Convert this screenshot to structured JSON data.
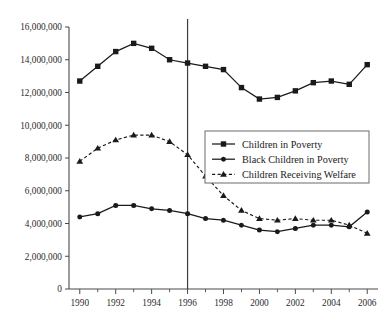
{
  "chart_data": {
    "type": "line",
    "title": "",
    "subtitle": "",
    "xlabel": "",
    "ylabel": "",
    "x": [
      1990,
      1991,
      1992,
      1993,
      1994,
      1995,
      1996,
      1997,
      1998,
      1999,
      2000,
      2001,
      2002,
      2003,
      2004,
      2005,
      2006
    ],
    "xlim": [
      1989.4,
      2006.6
    ],
    "ylim": [
      0,
      16000000
    ],
    "ytick_values": [
      0,
      2000000,
      4000000,
      6000000,
      8000000,
      10000000,
      12000000,
      14000000,
      16000000
    ],
    "ytick_labels": [
      "0",
      "2,000,000",
      "4,000,000",
      "6,000,000",
      "8,000,000",
      "10,000,000",
      "12,000,000",
      "14,000,000",
      "16,000,000"
    ],
    "xtick_values": [
      1990,
      1992,
      1994,
      1996,
      1998,
      2000,
      2002,
      2004,
      2006
    ],
    "xtick_labels": [
      "1990",
      "1992",
      "1994",
      "1996",
      "1998",
      "2000",
      "2002",
      "2004",
      "2006"
    ],
    "xtick_minor_values": [
      1991,
      1993,
      1995,
      1997,
      1999,
      2001,
      2003,
      2005
    ],
    "grid": false,
    "legend_position": "center-right",
    "annotations": [
      {
        "name": "welfare-reform-reference-line",
        "type": "vline",
        "x": 1996,
        "label": ""
      }
    ],
    "series": [
      {
        "name": "Children in Poverty",
        "marker": "square",
        "linestyle": "solid",
        "color": "#1a1a1a",
        "values": [
          12700000,
          13600000,
          14500000,
          15000000,
          14700000,
          14000000,
          13800000,
          13600000,
          13400000,
          12300000,
          11600000,
          11700000,
          12100000,
          12600000,
          12700000,
          12500000,
          13700000
        ]
      },
      {
        "name": "Black Children in Poverty",
        "marker": "circle",
        "linestyle": "solid",
        "color": "#1a1a1a",
        "values": [
          4400000,
          4600000,
          5100000,
          5100000,
          4900000,
          4800000,
          4600000,
          4300000,
          4200000,
          3900000,
          3600000,
          3500000,
          3700000,
          3900000,
          3900000,
          3800000,
          4700000
        ]
      },
      {
        "name": "Children Receiving Welfare",
        "marker": "triangle",
        "linestyle": "dashed",
        "color": "#1a1a1a",
        "values": [
          7800000,
          8600000,
          9100000,
          9400000,
          9400000,
          9000000,
          8200000,
          6900000,
          5700000,
          4800000,
          4300000,
          4200000,
          4300000,
          4200000,
          4200000,
          3900000,
          3400000
        ]
      }
    ]
  }
}
